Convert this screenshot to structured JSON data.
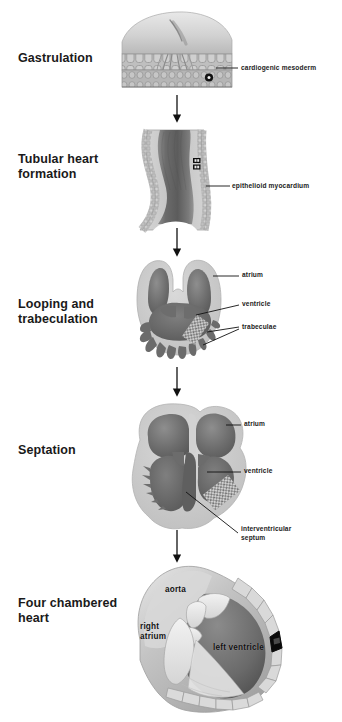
{
  "figure": {
    "background_color": "#ffffff",
    "text_color": "#1a1a1a",
    "tissue_light": "#cfcfcf",
    "tissue_mid": "#9a9a9a",
    "tissue_dark": "#6f6f6f",
    "lumen_dark": "#5e5e5e"
  },
  "stages": [
    {
      "id": "gastrulation",
      "label": "Gastrulation",
      "callouts": [
        {
          "id": "cardiogenic-mesoderm",
          "text": "cardiogenic mesoderm"
        }
      ],
      "inline_labels": []
    },
    {
      "id": "tubular-heart-formation",
      "label": "Tubular heart\nformation",
      "callouts": [
        {
          "id": "epithelioid-myocardium",
          "text": "epithelioid myocardium"
        }
      ],
      "inline_labels": []
    },
    {
      "id": "looping-and-trabeculation",
      "label": "Looping and\ntrabeculation",
      "callouts": [
        {
          "id": "atrium",
          "text": "atrium"
        },
        {
          "id": "ventricle",
          "text": "ventricle"
        },
        {
          "id": "trabeculae",
          "text": "trabeculae"
        }
      ],
      "inline_labels": []
    },
    {
      "id": "septation",
      "label": "Septation",
      "callouts": [
        {
          "id": "atrium",
          "text": "atrium"
        },
        {
          "id": "ventricle",
          "text": "ventricle"
        },
        {
          "id": "interventricular-septum",
          "text": "interventricular\nseptum"
        }
      ],
      "inline_labels": []
    },
    {
      "id": "four-chambered-heart",
      "label": "Four chambered\nheart",
      "callouts": [],
      "inline_labels": [
        {
          "id": "aorta",
          "text": "aorta"
        },
        {
          "id": "right-atrium",
          "text": "right\natrium"
        },
        {
          "id": "left-ventricle",
          "text": "left ventricle"
        }
      ]
    }
  ],
  "arrows": [
    {
      "id": "arrow-gastrulation-to-tubular"
    },
    {
      "id": "arrow-tubular-to-looping"
    },
    {
      "id": "arrow-looping-to-septation"
    },
    {
      "id": "arrow-septation-to-four-chambered"
    }
  ]
}
